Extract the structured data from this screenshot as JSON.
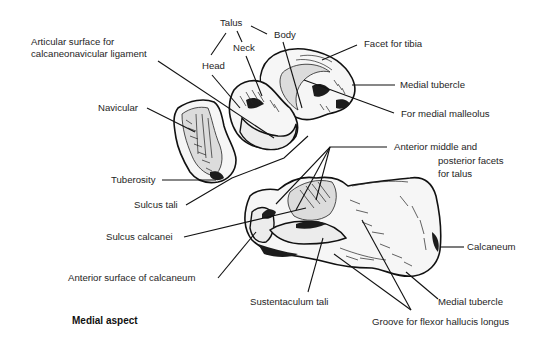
{
  "figure": {
    "caption": "Medial aspect",
    "bones": [
      "Talus",
      "Navicular",
      "Calcaneum"
    ]
  },
  "labels": {
    "talus": "Talus",
    "neck": "Neck",
    "body": "Body",
    "head": "Head",
    "articular_surface_line1": "Articular surface for",
    "articular_surface_line2": "calcaneonavicular ligament",
    "facet_for_tibia": "Facet for tibia",
    "medial_tubercle_talus": "Medial tubercle",
    "for_medial_malleolus": "For medial malleolus",
    "navicular": "Navicular",
    "tuberosity": "Tuberosity",
    "anterior_facets_line1": "Anterior middle and",
    "anterior_facets_line2": "posterior facets",
    "anterior_facets_line3": "for talus",
    "sulcus_tali": "Sulcus tali",
    "sulcus_calcanei": "Sulcus calcanei",
    "anterior_surface_calcaneum": "Anterior surface of calcaneum",
    "calcaneum": "Calcaneum",
    "sustentaculum_tali": "Sustentaculum tali",
    "medial_tubercle_calcaneum": "Medial tubercle",
    "groove_fhl": "Groove for flexor hallucis longus"
  }
}
